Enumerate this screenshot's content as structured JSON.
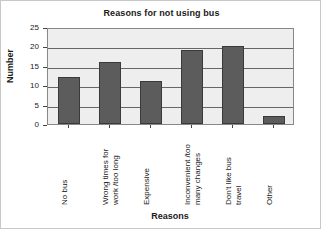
{
  "chart_data": {
    "type": "bar",
    "title": "Reasons for not using bus",
    "xlabel": "Reasons",
    "ylabel": "Number",
    "categories": [
      "No bus",
      "Wrong times for\nwork /too long",
      "Expensive",
      "Inconvenient /too\nmany changes",
      "Don't like bus\ntravel",
      "Other"
    ],
    "values": [
      12,
      16,
      11,
      19,
      20,
      2
    ],
    "ylim": [
      0,
      25
    ],
    "yticks": [
      0,
      5,
      10,
      15,
      20,
      25
    ],
    "ytick_labels": [
      "0",
      "5",
      "10",
      "15",
      "20",
      "25"
    ],
    "grid": true,
    "legend": false,
    "bar_color": "#5c5c5c",
    "bar_edge_color": "#3a3a3a",
    "plot_background": "#eeeeee",
    "axis_color": "#666666"
  }
}
